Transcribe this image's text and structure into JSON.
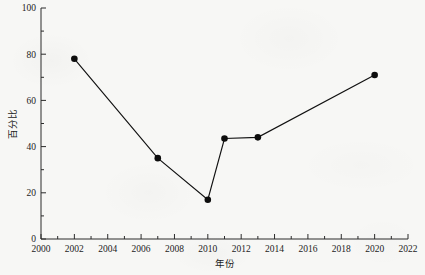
{
  "chart_data": {
    "type": "line",
    "title": "",
    "xlabel": "年份",
    "ylabel": "百分比",
    "xlim": [
      2000,
      2022
    ],
    "ylim": [
      0,
      100
    ],
    "xticks": [
      2000,
      2002,
      2004,
      2006,
      2008,
      2010,
      2012,
      2014,
      2016,
      2018,
      2020,
      2022
    ],
    "xtick_labels": [
      "2000",
      "2002",
      "2004",
      "2006",
      "2008",
      "2010",
      "2012",
      "2014",
      "2016",
      "2018",
      "2020",
      "2022"
    ],
    "yticks": [
      0,
      20,
      40,
      60,
      80,
      100
    ],
    "ytick_labels": [
      "0",
      "20",
      "40",
      "60",
      "80",
      "100"
    ],
    "y_minor_ticks": [
      10,
      30,
      50,
      70,
      90
    ],
    "x_minor_ticks": [
      2001,
      2003,
      2005,
      2007,
      2009,
      2011,
      2013,
      2015,
      2017,
      2019,
      2021
    ],
    "grid": false,
    "legend": null,
    "series": [
      {
        "name": "百分比",
        "marker": "circle",
        "color": "#0d0d0d",
        "x": [
          2002,
          2007,
          2010,
          2011,
          2013,
          2020
        ],
        "values": [
          78,
          35,
          17,
          43.5,
          44,
          71
        ]
      }
    ],
    "points": [
      {
        "year": 2002,
        "value": 78
      },
      {
        "year": 2007,
        "value": 35
      },
      {
        "year": 2010,
        "value": 17
      },
      {
        "year": 2011,
        "value": 43.5
      },
      {
        "year": 2013,
        "value": 44
      },
      {
        "year": 2020,
        "value": 71
      }
    ]
  },
  "axes": {
    "x_title": "年份",
    "y_title": "百分比"
  }
}
